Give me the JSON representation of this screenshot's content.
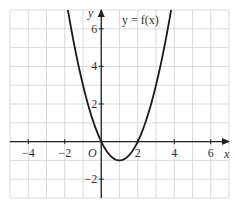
{
  "chart_data": {
    "type": "line",
    "title": "",
    "curve_label": "y = f(x)",
    "xlabel": "x",
    "ylabel": "y",
    "origin_label": "O",
    "xlim": [
      -5,
      7
    ],
    "ylim": [
      -3,
      7
    ],
    "grid": true,
    "x_ticks": [
      -4,
      -2,
      2,
      4,
      6
    ],
    "x_tick_labels": [
      "−4",
      "−2",
      "2",
      "4",
      "6"
    ],
    "y_ticks": [
      -2,
      2,
      4,
      6
    ],
    "y_tick_labels": [
      "−2",
      "2",
      "4",
      "6"
    ],
    "series": [
      {
        "name": "y = f(x)",
        "equation": "y = x^2 - 2x",
        "x": [
          -1.5,
          -1,
          -0.5,
          0,
          0.5,
          1,
          1.5,
          2,
          2.5,
          3,
          3.5
        ],
        "y": [
          5.25,
          3,
          1.25,
          0,
          -0.75,
          -1,
          -0.75,
          0,
          1.25,
          3,
          5.25
        ]
      }
    ],
    "key_points": {
      "roots": [
        0,
        2
      ],
      "minimum": [
        1,
        -1
      ]
    },
    "colors": {
      "curve": "#1a1a1a",
      "axes": "#222222",
      "grid": "#cfcfcf"
    }
  }
}
